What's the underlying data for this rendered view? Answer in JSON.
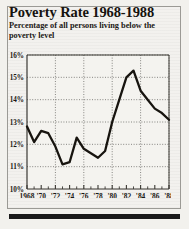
{
  "card": {
    "title": "Poverty Rate 1968-1988",
    "subtitle": "Percentage of all persons living below the poverty level"
  },
  "colors": {
    "paper": "#eceae5",
    "ink": "#1b1814",
    "line": "#17140f",
    "grid": "#6b6a66",
    "axis": "#3a3833"
  },
  "chart_data": {
    "type": "line",
    "title": "Poverty Rate 1968-1988",
    "subtitle": "Percentage of all persons living below the poverty level",
    "xlabel": "",
    "ylabel": "",
    "xlim": [
      1968,
      1988
    ],
    "ylim": [
      10,
      16
    ],
    "ytick_labels": [
      "10%",
      "11%",
      "12%",
      "13%",
      "14%",
      "15%",
      "16%"
    ],
    "ytick_values": [
      10,
      11,
      12,
      13,
      14,
      15,
      16
    ],
    "xtick_labels": [
      "1968",
      "'70",
      "'72",
      "'74",
      "'76",
      "'78",
      "'80",
      "'82",
      "'84",
      "'86",
      "'88"
    ],
    "xtick_values": [
      1968,
      1970,
      1972,
      1974,
      1976,
      1978,
      1980,
      1982,
      1984,
      1986,
      1988
    ],
    "grid": "dotted-horizontal-and-vertical",
    "gridline_x_values": [
      1972,
      1976,
      1980,
      1984,
      1988
    ],
    "minor_xticks": "every year",
    "legend": "none",
    "x": [
      1968,
      1969,
      1970,
      1971,
      1972,
      1973,
      1974,
      1975,
      1976,
      1977,
      1978,
      1979,
      1980,
      1981,
      1982,
      1983,
      1984,
      1985,
      1986,
      1987,
      1988
    ],
    "values": [
      12.8,
      12.1,
      12.6,
      12.5,
      11.9,
      11.1,
      11.2,
      12.3,
      11.8,
      11.6,
      11.4,
      11.7,
      13.0,
      14.0,
      15.0,
      15.3,
      14.4,
      14.0,
      13.6,
      13.4,
      13.1
    ],
    "series": [
      {
        "name": "Poverty rate",
        "values": [
          12.8,
          12.1,
          12.6,
          12.5,
          11.9,
          11.1,
          11.2,
          12.3,
          11.8,
          11.6,
          11.4,
          11.7,
          13.0,
          14.0,
          15.0,
          15.3,
          14.4,
          14.0,
          13.6,
          13.4,
          13.1
        ]
      }
    ],
    "annotations": []
  }
}
